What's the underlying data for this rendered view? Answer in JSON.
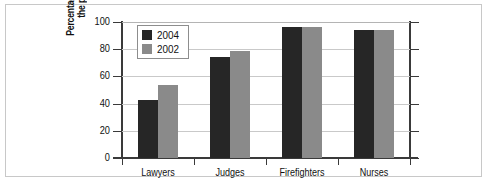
{
  "chart_data": {
    "type": "bar",
    "title": "",
    "xlabel": "",
    "ylabel_lines": [
      "Percentage who admire",
      "the profession"
    ],
    "categories": [
      "Lawyers",
      "Judges",
      "Firefighters",
      "Nurses"
    ],
    "series": [
      {
        "name": "2004",
        "color": "#262626",
        "values": [
          43,
          74,
          96,
          94
        ]
      },
      {
        "name": "2002",
        "color": "#8a8a8a",
        "values": [
          54,
          79,
          96,
          94
        ]
      }
    ],
    "ylim": [
      0,
      100
    ],
    "yticks": [
      0,
      20,
      40,
      60,
      80,
      100
    ],
    "ytick_labels": [
      "0",
      "20",
      "40",
      "60",
      "80",
      "100"
    ],
    "grid": true,
    "grid_axis": "y",
    "legend_position": "upper-left-inside"
  },
  "figure": {
    "background": "#ffffff",
    "frame_color": "#c8c8c8",
    "axis_color": "#3a3a3a",
    "grid_color": "#c9c9c9"
  }
}
